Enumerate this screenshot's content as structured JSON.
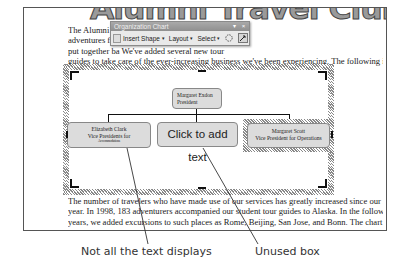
{
  "document": {
    "wordart_title": "Alumni Travel Club",
    "paragraph1_lines": [
      "The Alumni Tr                                                    times unorthodox small group",
      "adventures for                                                    by Margaret Exdon. The team she",
      "put together ba                                              We've added several new tour",
      "guides to take care of the ever-increasing business we've been experiencing.  The following is a",
      "chart showing the organization of the travel club."
    ],
    "paragraph2_lines": [
      "The number of travelers who have made use of our services has greatly increased since our first",
      "year.  In 1998, 183 adventurers accompanied our student tour guides to Alaska.  In the following",
      "years, we added excursions to such places as Rome, Beijing, San Jose, and Bonn.  The chart"
    ]
  },
  "toolbar": {
    "title": "Organization Chart",
    "minimize_glyph": "▾",
    "close_glyph": "×",
    "buttons": [
      {
        "label": "Insert Shape",
        "has_dropdown": true
      },
      {
        "label": "Layout",
        "has_dropdown": true
      },
      {
        "label": "Select",
        "has_dropdown": true
      }
    ],
    "autoformat_icon": "autoformat-icon",
    "fit_text_icon": "fit-text-icon",
    "caret": "▾"
  },
  "org_chart": {
    "top": {
      "name": "Margaret Exdon",
      "title": "President"
    },
    "children": [
      {
        "name": "Elizabeth Clark",
        "title": "Vice Presidents for",
        "overflow": "Accommodations"
      },
      {
        "placeholder": "Click to add text"
      },
      {
        "name": "Margaret Scott",
        "title": "Vice President for Operations"
      }
    ]
  },
  "captions": {
    "left": "Not all the text displays",
    "right": "Unused box"
  },
  "colors": {
    "box_fill": "#dcdcdc",
    "toolbar_title": "#999999",
    "caption_text": "#333333"
  }
}
